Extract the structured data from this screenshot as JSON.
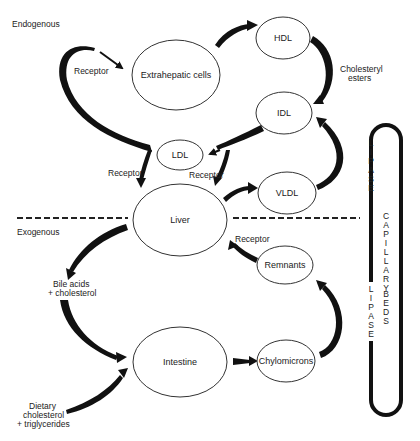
{
  "regions": {
    "endogenous": "Endogenous",
    "exogenous": "Exogenous"
  },
  "nodes": {
    "extrahepatic": "Extrahepatic cells",
    "hdl": "HDL",
    "idl": "IDL",
    "ldl": "LDL",
    "liver": "Liver",
    "vldl": "VLDL",
    "remnants": "Remnants",
    "intestine": "Intestine",
    "chylomicrons": "Chylomicrons"
  },
  "labels": {
    "receptor_top": "Receptor",
    "receptor_left": "Receptor",
    "receptor_mid": "Receptor",
    "receptor_remnants": "Receptor",
    "cholesteryl_1": "Cholesteryl",
    "cholesteryl_2": "esters",
    "bile_1": "Bile acids",
    "bile_2": "+ cholesterol",
    "dietary_1": "Dietary",
    "dietary_2": "cholesterol",
    "dietary_3": "+ triglycerides"
  },
  "capillary": {
    "lipase_top": [
      "L",
      "I",
      "P",
      "A",
      "S",
      "E"
    ],
    "capillary": [
      "C",
      "A",
      "P",
      "I",
      "L",
      "L",
      "A",
      "R",
      "Y"
    ],
    "beds": [
      "B",
      "E",
      "D",
      "S"
    ],
    "lipase_bottom": [
      "L",
      "I",
      "P",
      "A",
      "S",
      "E"
    ]
  },
  "colors": {
    "ink": "#111111",
    "outline": "#333333",
    "background": "#ffffff"
  }
}
